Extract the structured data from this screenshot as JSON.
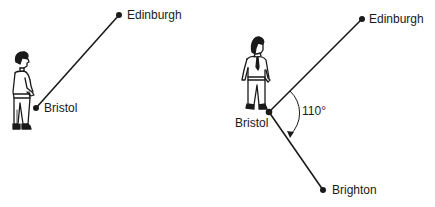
{
  "diagram": {
    "type": "bearing-direction-illustration",
    "panels": [
      {
        "id": "left",
        "description": "Person at Bristol looking toward Edinburgh",
        "points": [
          {
            "name": "Edinburgh",
            "label": "Edinburgh"
          },
          {
            "name": "Bristol",
            "label": "Bristol"
          }
        ],
        "lines": [
          {
            "from": "Bristol",
            "to": "Edinburgh"
          }
        ]
      },
      {
        "id": "right",
        "description": "Person at Bristol turning from Edinburgh direction toward Brighton",
        "points": [
          {
            "name": "Edinburgh",
            "label": "Edinburgh"
          },
          {
            "name": "Bristol",
            "label": "Bristol"
          },
          {
            "name": "Brighton",
            "label": "Brighton"
          }
        ],
        "lines": [
          {
            "from": "Bristol",
            "to": "Edinburgh"
          },
          {
            "from": "Bristol",
            "to": "Brighton"
          }
        ],
        "angle": {
          "vertex": "Bristol",
          "value": 110,
          "label": "110°",
          "direction": "clockwise"
        }
      }
    ]
  },
  "labels": {
    "left_edinburgh": "Edinburgh",
    "left_bristol": "Bristol",
    "right_edinburgh": "Edinburgh",
    "right_bristol": "Bristol",
    "right_brighton": "Brighton",
    "angle": "110°"
  },
  "colors": {
    "ink": "#1a1a1a",
    "background": "#ffffff"
  }
}
